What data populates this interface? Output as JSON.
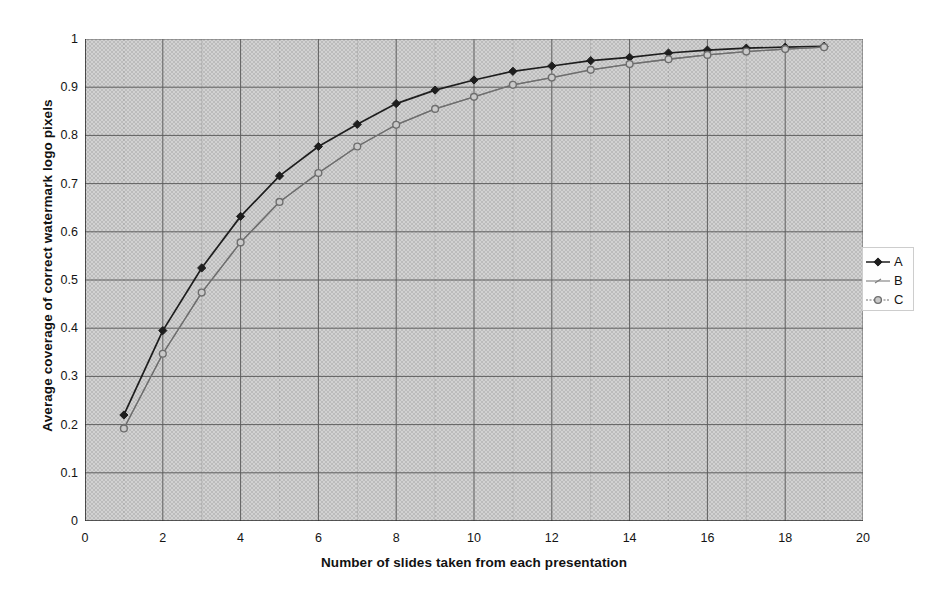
{
  "chart_data": {
    "type": "line",
    "title": "",
    "xlabel": "Number of slides taken from each presentation",
    "ylabel": "Average coverage of correct watermark logo pixels",
    "xlim": [
      0,
      20
    ],
    "ylim": [
      0,
      1
    ],
    "xticks": [
      0,
      2,
      4,
      6,
      8,
      10,
      12,
      14,
      16,
      18,
      20
    ],
    "xtick_labels": [
      "0",
      "2",
      "4",
      "6",
      "8",
      "10",
      "12",
      "14",
      "16",
      "18",
      "20"
    ],
    "yticks": [
      0,
      0.1,
      0.2,
      0.3,
      0.4,
      0.5,
      0.6,
      0.7,
      0.8,
      0.9,
      1
    ],
    "ytick_labels": [
      "0",
      "0.1",
      "0.2",
      "0.3",
      "0.4",
      "0.5",
      "0.6",
      "0.7",
      "0.8",
      "0.9",
      "1"
    ],
    "grid": true,
    "grid_minor_x": true,
    "legend_position": "right",
    "plot_background": "#d2d2d2",
    "x": [
      1,
      2,
      3,
      4,
      5,
      6,
      7,
      8,
      9,
      10,
      11,
      12,
      13,
      14,
      15,
      16,
      17,
      18,
      19
    ],
    "series": [
      {
        "name": "A",
        "marker": "filled-diamond",
        "color": "#1e1e1e",
        "values": [
          0.22,
          0.395,
          0.525,
          0.632,
          0.716,
          0.777,
          0.823,
          0.866,
          0.894,
          0.915,
          0.933,
          0.944,
          0.955,
          0.962,
          0.971,
          0.977,
          0.981,
          0.983,
          0.985
        ]
      },
      {
        "name": "B",
        "marker": "small-dash",
        "color": "#7c7c7c",
        "values": [
          0.192,
          0.347,
          0.474,
          0.578,
          0.662,
          0.722,
          0.777,
          0.822,
          0.855,
          0.88,
          0.905,
          0.92,
          0.936,
          0.948,
          0.958,
          0.967,
          0.974,
          0.979,
          0.983
        ]
      },
      {
        "name": "C",
        "marker": "open-circle",
        "color": "#6e6e6e",
        "values": [
          0.192,
          0.347,
          0.474,
          0.578,
          0.662,
          0.722,
          0.777,
          0.822,
          0.855,
          0.88,
          0.905,
          0.92,
          0.936,
          0.948,
          0.958,
          0.967,
          0.974,
          0.979,
          0.983
        ]
      }
    ]
  },
  "legend": {
    "entries": [
      {
        "label": "A"
      },
      {
        "label": "B"
      },
      {
        "label": "C"
      }
    ]
  }
}
